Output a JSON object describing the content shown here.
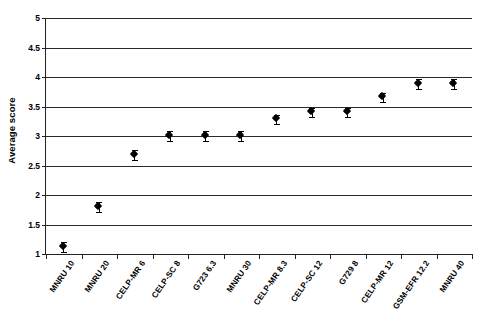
{
  "chart_data": {
    "type": "scatter",
    "title": "",
    "xlabel": "",
    "ylabel": "Average score",
    "ylim": [
      1,
      5
    ],
    "ytick_step": 0.5,
    "yticks": [
      "5",
      "4.5",
      "4",
      "3.5",
      "3",
      "2.5",
      "2",
      "1.5",
      "1"
    ],
    "grid": true,
    "legend": "none",
    "marker_style": "black-diamond",
    "error_bars": true,
    "categories": [
      "MNRU 10",
      "MNRU 20",
      "CELP-MR 6",
      "CELP-SC 8",
      "G723 6.3",
      "MNRU 30",
      "CELP-MR 8.3",
      "CELP-SC 12",
      "G729 8",
      "CELP-MR 12",
      "GSM-EFR 12.2",
      "MNRU 40"
    ],
    "values": [
      1.12,
      1.8,
      2.68,
      3.0,
      3.0,
      3.0,
      3.28,
      3.4,
      3.4,
      3.65,
      3.88,
      3.88
    ],
    "errors": [
      0.09,
      0.09,
      0.08,
      0.09,
      0.09,
      0.09,
      0.08,
      0.08,
      0.08,
      0.08,
      0.08,
      0.08
    ],
    "series": [
      {
        "name": "Average score",
        "values": [
          1.12,
          1.8,
          2.68,
          3.0,
          3.0,
          3.0,
          3.28,
          3.4,
          3.4,
          3.65,
          3.88,
          3.88
        ]
      }
    ],
    "colors": {
      "marker": "#000000",
      "grid": "#2b2b2b",
      "axis": "#222222",
      "background": "#ffffff"
    }
  }
}
